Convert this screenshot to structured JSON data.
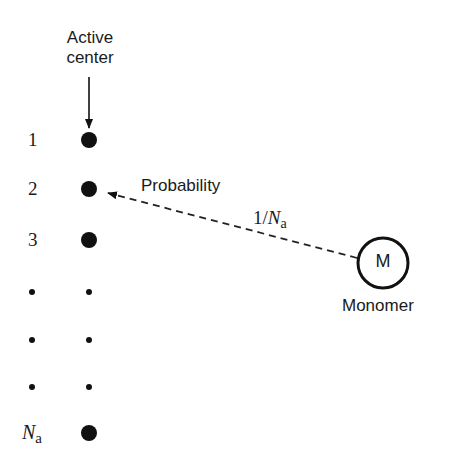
{
  "diagram": {
    "active_center_label_line1": "Active",
    "active_center_label_line2": "center",
    "probability_label": "Probability",
    "probability_value_prefix": "1/",
    "probability_value_N": "N",
    "probability_value_sub": "a",
    "monomer_symbol": "M",
    "monomer_label": "Monomer",
    "rows": [
      {
        "label": "1",
        "dot": "large"
      },
      {
        "label": "2",
        "dot": "large"
      },
      {
        "label": "3",
        "dot": "large"
      },
      {
        "label": "•",
        "dot": "small"
      },
      {
        "label": "•",
        "dot": "small"
      },
      {
        "label": "•",
        "dot": "small"
      },
      {
        "label_N": "N",
        "label_sub": "a",
        "dot": "large"
      }
    ],
    "colors": {
      "ink": "#111111",
      "background": "#ffffff"
    }
  }
}
